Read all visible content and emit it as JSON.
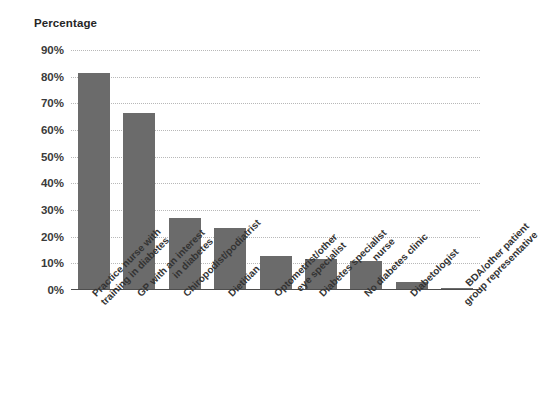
{
  "chart_data": {
    "type": "bar",
    "title": "Percentage",
    "xlabel": "",
    "ylabel": "Percentage",
    "ylim": [
      0,
      90
    ],
    "grid": true,
    "legend": "none",
    "orientation": "vertical",
    "bar_color": "#6b6b6b",
    "gridline_color": "#b8b8b8",
    "axis_color": "#4d4d4d",
    "categories": [
      "Practice nurse with\ntraining in diabetes",
      "GP with an interest\nin diabetes",
      "Chiropodist/podiatrist",
      "Dietitian",
      "Optometrist/other\neye specialist",
      "Diabetes specialist\nnurse",
      "No diabetes clinic",
      "Diabetologist",
      "BDA/other patient\ngroup representative"
    ],
    "values": [
      81.5,
      66.5,
      27.0,
      23.3,
      12.6,
      11.6,
      10.8,
      3.0,
      0.6
    ],
    "y_ticks": [
      0,
      10,
      20,
      30,
      40,
      50,
      60,
      70,
      80,
      90
    ],
    "y_tick_labels": [
      "0%",
      "10%",
      "20%",
      "30%",
      "40%",
      "50%",
      "60%",
      "70%",
      "80%",
      "90%"
    ]
  }
}
